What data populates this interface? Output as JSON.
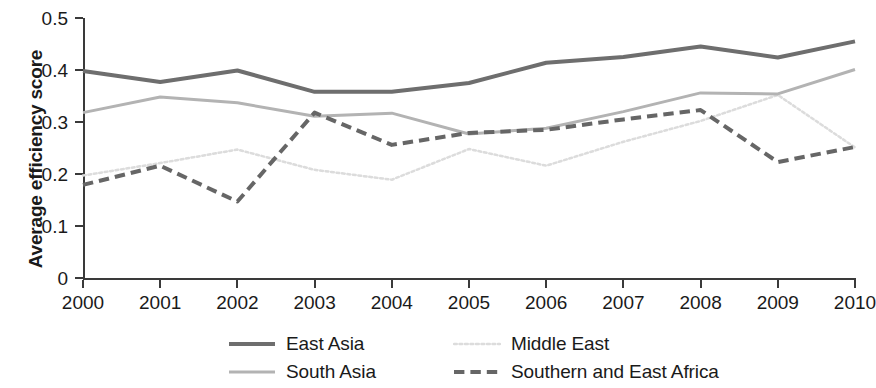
{
  "chart_data": {
    "type": "line",
    "title": "",
    "xlabel": "",
    "ylabel": "Average efficiency score",
    "x": [
      2000,
      2001,
      2002,
      2003,
      2004,
      2005,
      2006,
      2007,
      2008,
      2009,
      2010
    ],
    "xticklabels": [
      "2000",
      "2001",
      "2002",
      "2003",
      "2004",
      "2005",
      "2006",
      "2007",
      "2008",
      "2009",
      "2010"
    ],
    "yticklabels": [
      "0",
      "0.1",
      "0.2",
      "0.3",
      "0.4",
      "0.5"
    ],
    "ytickvalues": [
      0,
      0.1,
      0.2,
      0.3,
      0.4,
      0.5
    ],
    "ylim": [
      0,
      0.5
    ],
    "xlim": [
      2000,
      2010
    ],
    "grid": false,
    "legend_position": "bottom",
    "series": [
      {
        "name": "East Asia",
        "style": "solid",
        "color": "#6e6e6e",
        "width": 4,
        "values": [
          0.398,
          0.377,
          0.399,
          0.358,
          0.358,
          0.375,
          0.414,
          0.425,
          0.445,
          0.424,
          0.455
        ]
      },
      {
        "name": "South Asia",
        "style": "solid",
        "color": "#b3b3b3",
        "width": 3,
        "values": [
          0.318,
          0.348,
          0.337,
          0.311,
          0.317,
          0.277,
          0.288,
          0.32,
          0.356,
          0.354,
          0.401
        ]
      },
      {
        "name": "Middle East",
        "style": "dotted",
        "color": "#dcdcdc",
        "width": 2.5,
        "values": [
          0.197,
          0.221,
          0.247,
          0.208,
          0.189,
          0.248,
          0.216,
          0.262,
          0.302,
          0.352,
          0.251
        ]
      },
      {
        "name": "Southern and East Africa",
        "style": "dashed",
        "color": "#666666",
        "width": 4,
        "values": [
          0.179,
          0.216,
          0.147,
          0.318,
          0.256,
          0.279,
          0.285,
          0.305,
          0.323,
          0.223,
          0.252
        ]
      }
    ]
  },
  "legend": {
    "rows": [
      [
        {
          "label": "East Asia",
          "series_index": 0
        },
        {
          "label": "Middle East",
          "series_index": 2
        }
      ],
      [
        {
          "label": "South Asia",
          "series_index": 1
        },
        {
          "label": "Southern and East Africa",
          "series_index": 3
        }
      ]
    ]
  }
}
